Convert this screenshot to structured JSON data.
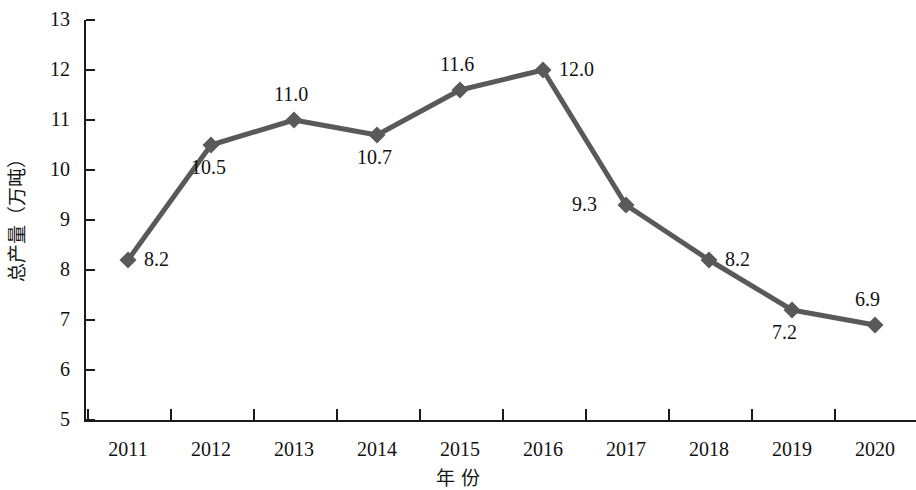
{
  "chart_data": {
    "type": "line",
    "title": "",
    "xlabel": "年 份",
    "ylabel": "总产量（万吨）",
    "categories": [
      "2011",
      "2012",
      "2013",
      "2014",
      "2015",
      "2016",
      "2017",
      "2018",
      "2019",
      "2020"
    ],
    "values": [
      8.2,
      10.5,
      11.0,
      10.7,
      11.6,
      12.0,
      9.3,
      8.2,
      7.2,
      6.9
    ],
    "value_labels": [
      "8.2",
      "10.5",
      "11.0",
      "10.7",
      "11.6",
      "12.0",
      "9.3",
      "8.2",
      "7.2",
      "6.9"
    ],
    "ylim": [
      5,
      13
    ],
    "yticks": [
      5,
      6,
      7,
      8,
      9,
      10,
      11,
      12,
      13
    ],
    "ytick_labels": [
      "5",
      "6",
      "7",
      "8",
      "9",
      "10",
      "11",
      "12",
      "13"
    ],
    "grid": false,
    "legend": null,
    "series_color": "#595959",
    "marker": "diamond",
    "label_positions": [
      "right",
      "below",
      "above",
      "below",
      "above",
      "right",
      "left",
      "right",
      "below",
      "above"
    ]
  },
  "axis": {
    "x_title": "年 份",
    "y_title": "总产量（万吨）"
  }
}
